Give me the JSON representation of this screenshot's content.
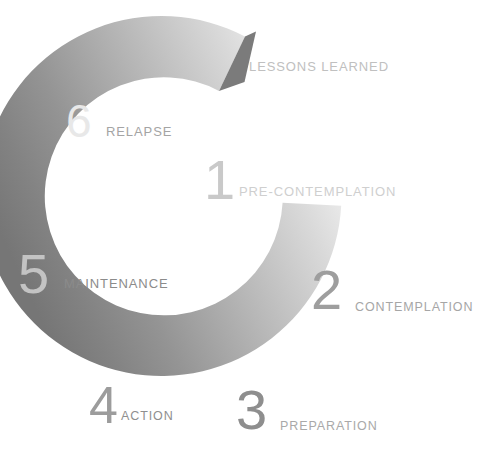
{
  "figure": {
    "title": "Stages of Change",
    "title_visible": false,
    "background_color": "#ffffff",
    "width": 499,
    "height": 464
  },
  "ring": {
    "shape": "open-c-ring-with-arrow-tip",
    "gap_position": "upper-right",
    "direction": "clockwise",
    "center_x": 172,
    "center_y": 242,
    "outer_radius": 180,
    "inner_radius": 118,
    "stroke_width": 61,
    "gradient": {
      "type": "linear-progressive-grayscale",
      "from_label": "stage-1-lightest",
      "to_label": "stage-6-darkest",
      "stops": [
        {
          "stage": 1,
          "color": "#f2f2f2"
        },
        {
          "stage": 2,
          "color": "#d6d6d6"
        },
        {
          "stage": 3,
          "color": "#bdbdbd"
        },
        {
          "stage": 4,
          "color": "#a6a6a6"
        },
        {
          "stage": 5,
          "color": "#8e8e8e"
        },
        {
          "stage": 6,
          "color": "#767676"
        }
      ]
    }
  },
  "stages": [
    {
      "number": "1",
      "label": "PRE-CONTEMPLATION",
      "number_color": "#c9c9c9",
      "label_color": "#cfcfcf"
    },
    {
      "number": "2",
      "label": "CONTEMPLATION",
      "number_color": "#9e9e9e",
      "label_color": "#a6a6a6"
    },
    {
      "number": "3",
      "label": "PREPARATION",
      "number_color": "#8e8e8e",
      "label_color": "#a9a9a9"
    },
    {
      "number": "4",
      "label": "ACTION",
      "number_color": "#9c9c9c",
      "label_color": "#8f8f8f"
    },
    {
      "number": "5",
      "label": "MAINTENANCE",
      "number_color": "#c3c3c3",
      "label_color": "#8b8b8b"
    },
    {
      "number": "6",
      "label": "RELAPSE",
      "number_color": "#e8e8e8",
      "label_color": "#a4a4a4"
    }
  ],
  "outcome": {
    "label": "LESSONS LEARNED",
    "label_color": "#c0c0c0"
  }
}
